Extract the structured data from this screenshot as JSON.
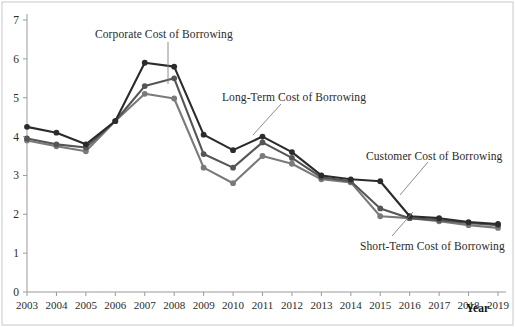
{
  "chart_data": {
    "type": "line",
    "title": "",
    "xlabel": "Year",
    "ylabel": "",
    "xlim": [
      2003,
      2019
    ],
    "ylim": [
      0,
      7
    ],
    "grid": false,
    "legend_position": "inline-annotations",
    "categories": [
      2003,
      2004,
      2005,
      2006,
      2007,
      2008,
      2009,
      2010,
      2011,
      2012,
      2013,
      2014,
      2015,
      2016,
      2017,
      2018,
      2019
    ],
    "xticklabels": [
      "2003",
      "2004",
      "2005",
      "2006",
      "2007",
      "2008",
      "2009",
      "2010",
      "2011",
      "2012",
      "2013",
      "2014",
      "2015",
      "2016",
      "2017",
      "2018",
      "2019"
    ],
    "yticklabels": [
      "0",
      "1",
      "2",
      "3",
      "4",
      "5",
      "6",
      "7"
    ],
    "yticks": [
      0,
      1,
      2,
      3,
      4,
      5,
      6,
      7
    ],
    "series": [
      {
        "name": "Corporate Cost of Borrowing",
        "color": "#2b2b2b",
        "values": [
          4.25,
          4.1,
          3.8,
          4.4,
          5.9,
          5.8,
          4.05,
          3.65,
          4.0,
          3.6,
          3.0,
          2.9,
          2.85,
          1.95,
          1.9,
          1.8,
          1.75
        ]
      },
      {
        "name": "Long-Term Cost of Borrowing",
        "color": "#555555",
        "values": [
          3.95,
          3.8,
          3.72,
          4.4,
          5.3,
          5.5,
          3.55,
          3.2,
          3.85,
          3.45,
          2.95,
          2.85,
          2.15,
          1.9,
          1.85,
          1.78,
          1.72
        ]
      },
      {
        "name": "Short-Term Cost of Borrowing",
        "color": "#7a7a7a",
        "values": [
          3.9,
          3.75,
          3.62,
          4.4,
          5.1,
          4.98,
          3.2,
          2.8,
          3.5,
          3.3,
          2.9,
          2.82,
          1.95,
          1.9,
          1.82,
          1.72,
          1.65
        ]
      }
    ],
    "annotations": [
      {
        "name": "Corporate Cost of Borrowing",
        "target_year": 2007,
        "target_value": 5.3
      },
      {
        "name": "Long-Term Cost of Borrowing",
        "target_year": 2010,
        "target_value": 3.55
      },
      {
        "name": "Customer Cost of Borrowing",
        "target_year": 2015,
        "target_value": 2.15
      },
      {
        "name": "Short-Term Cost of Borrowing",
        "target_year": 2016,
        "target_value": 1.9
      }
    ]
  },
  "axes": {
    "x_axis_title": "Year"
  },
  "colors": {
    "series_dark": "#2b2b2b",
    "series_mid": "#555555",
    "series_light": "#7a7a7a",
    "axis": "#9a9a9a",
    "background": "#ffffff",
    "frame": "#bdbdbd"
  },
  "labels": {
    "corporate": "Corporate Cost of Borrowing",
    "long_term": "Long-Term Cost of Borrowing",
    "customer": "Customer Cost of Borrowing",
    "short_term": "Short-Term Cost of Borrowing"
  }
}
